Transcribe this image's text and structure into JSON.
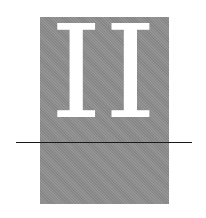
{
  "figure": {
    "numeral": "II",
    "colors": {
      "panel": "#8e8e8e",
      "numeral": "#ffffff",
      "rule": "#1a1a1a",
      "background": "#ffffff"
    }
  }
}
